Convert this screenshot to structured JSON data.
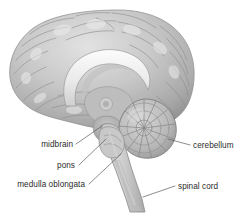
{
  "figure": {
    "background_color": "#ffffff",
    "label_text_color": "#2b2b2b",
    "leader_line_color": "#5a5a5a",
    "brain_tone_light": "#d8d8d8",
    "brain_tone_mid": "#b4b4b4",
    "brain_tone_dark": "#8e8e8e",
    "corpus_callosum_color": "#f2f2f2"
  },
  "labels": {
    "midbrain": "midbrain",
    "pons": "pons",
    "medulla_oblongata": "medulla oblongata",
    "cerebellum": "cerebellum",
    "spinal_cord": "spinal cord"
  },
  "structures": [
    {
      "name": "cerebrum",
      "label_shown": false
    },
    {
      "name": "corpus-callosum",
      "label_shown": false
    },
    {
      "name": "midbrain",
      "label_shown": true
    },
    {
      "name": "pons",
      "label_shown": true
    },
    {
      "name": "medulla-oblongata",
      "label_shown": true
    },
    {
      "name": "cerebellum",
      "label_shown": true
    },
    {
      "name": "spinal-cord",
      "label_shown": true
    }
  ]
}
